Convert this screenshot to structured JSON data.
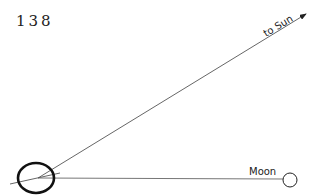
{
  "page_number": "138",
  "diagram": {
    "sun_label": "to Sun",
    "moon_label": "Moon",
    "colors": {
      "line": "#555555",
      "earth": "#111111",
      "moon": "#222222"
    }
  }
}
